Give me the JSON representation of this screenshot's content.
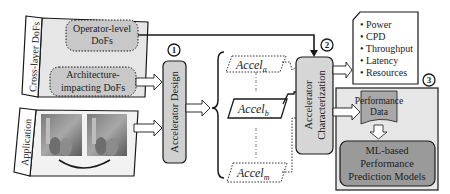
{
  "cross_layer": {
    "label": "Cross-layer DoFs",
    "operator_box": [
      "Operator-level",
      "DoFs"
    ],
    "architecture_box": [
      "Architecture-",
      "impacting DoFs"
    ]
  },
  "application": {
    "label": "Application"
  },
  "accelerator_design": {
    "step": "1",
    "label": "Accelerator Design"
  },
  "accelerators": {
    "a": {
      "base": "Accel",
      "sub": "a"
    },
    "b": {
      "base": "Accel",
      "sub": "b"
    },
    "m": {
      "base": "Accel",
      "sub": "m"
    }
  },
  "characterization": {
    "step": "2",
    "label": [
      "Accelerator",
      "Characterization"
    ]
  },
  "metrics": {
    "items": [
      "Power",
      "CPD",
      "Throughput",
      "Latency",
      "Resources"
    ]
  },
  "prediction": {
    "step": "3",
    "data_box": [
      "Performance",
      "Data"
    ],
    "model_box": [
      "ML-based",
      "Performance",
      "Prediction Models"
    ]
  },
  "colors": {
    "panel_fill": "#e6e6e6",
    "box_fill": "#c8c8c8",
    "dark_box_fill": "#9a9a9a",
    "stroke": "#1a1a1a"
  }
}
